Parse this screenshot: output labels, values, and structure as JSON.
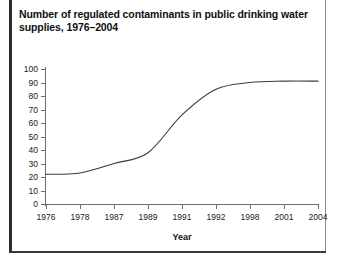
{
  "figure": {
    "title": "Number of regulated contaminants in public drinking water supplies, 1976–2004"
  },
  "chart_data": {
    "type": "line",
    "title": "Number of regulated contaminants in public drinking water supplies, 1976–2004",
    "xlabel": "Year",
    "ylabel": "",
    "categories": [
      "1976",
      "1978",
      "1987",
      "1989",
      "1991",
      "1992",
      "1998",
      "2001",
      "2004"
    ],
    "values": [
      22,
      23,
      30,
      38,
      66,
      85,
      90,
      91,
      91
    ],
    "ylim": [
      0,
      100
    ],
    "yticks": [
      0,
      10,
      20,
      30,
      40,
      50,
      60,
      70,
      80,
      90,
      100
    ],
    "ytick_labels": [
      "0",
      "10",
      "20",
      "30",
      "40",
      "50",
      "60",
      "70",
      "80",
      "90",
      "100"
    ],
    "xtick_labels": [
      "1976",
      "1978",
      "1987",
      "1989",
      "1991",
      "1992",
      "1998",
      "2001",
      "2004"
    ],
    "grid": false,
    "legend": false,
    "line_color": "#3a3a3a",
    "smoothed": true
  },
  "colors": {
    "line": "#3a3a3a",
    "axis": "#6d6d6d",
    "text": "#1a1a1a",
    "frame": "#2b2b2b",
    "background": "#ffffff"
  }
}
